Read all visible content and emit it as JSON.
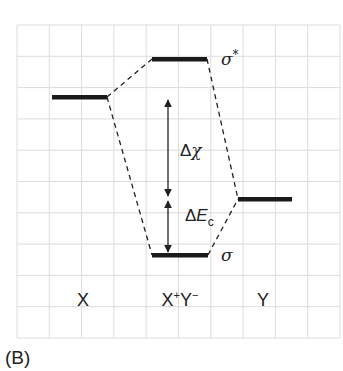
{
  "diagram": {
    "panel_label": "(B)",
    "type": "molecular-orbital-energy-diagram",
    "columns": [
      {
        "id": "x",
        "label": "X"
      },
      {
        "id": "xy",
        "label_main": "X",
        "label_sup1": "+",
        "label_mid": "Y",
        "label_sup2": "−"
      },
      {
        "id": "y",
        "label": "Y"
      }
    ],
    "levels": {
      "x": {
        "label": ""
      },
      "sigma_star": {
        "label": "σ",
        "sup": "*"
      },
      "y": {
        "label": ""
      },
      "sigma": {
        "label": "σ"
      }
    },
    "annotations": {
      "delta_chi": {
        "prefix": "Δ",
        "symbol": "χ"
      },
      "delta_ec": {
        "prefix": "Δ",
        "symbol": "E",
        "sub": "c"
      }
    },
    "colors": {
      "grid": "#dcdcdc",
      "bar": "#1a1a1a",
      "line": "#222222",
      "text": "#222222"
    }
  }
}
